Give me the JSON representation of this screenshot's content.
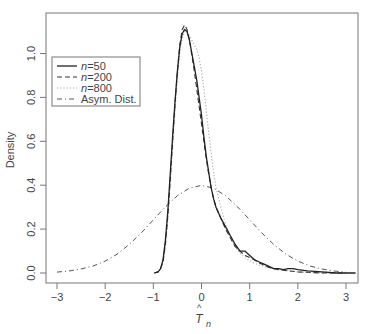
{
  "chart_data": {
    "type": "line",
    "title": "",
    "xlabel": "T̂n",
    "ylabel": "Density",
    "xlim": [
      -3.2,
      3.2
    ],
    "ylim": [
      -0.03,
      1.18
    ],
    "xticks": [
      -3,
      -2,
      -1,
      0,
      1,
      2,
      3
    ],
    "yticks": [
      0.0,
      0.2,
      0.4,
      0.6,
      0.8,
      1.0
    ],
    "ytick_labels": [
      "0.0",
      "0.2",
      "0.4",
      "0.6",
      "0.8",
      "1.0"
    ],
    "grid": false,
    "legend_position": "upper-left",
    "series": [
      {
        "name": "n=50",
        "style": "solid",
        "x": [
          -0.98,
          -0.9,
          -0.85,
          -0.8,
          -0.75,
          -0.7,
          -0.65,
          -0.6,
          -0.55,
          -0.5,
          -0.45,
          -0.4,
          -0.35,
          -0.3,
          -0.25,
          -0.2,
          -0.15,
          -0.1,
          -0.05,
          0.0,
          0.05,
          0.1,
          0.15,
          0.2,
          0.25,
          0.3,
          0.4,
          0.5,
          0.6,
          0.7,
          0.8,
          0.9,
          1.0,
          1.1,
          1.2,
          1.3,
          1.4,
          1.5,
          1.6,
          1.7,
          1.8,
          1.9,
          2.0,
          2.2,
          2.5,
          2.8,
          3.2
        ],
        "y": [
          0.0,
          0.005,
          0.02,
          0.06,
          0.15,
          0.28,
          0.45,
          0.62,
          0.78,
          0.92,
          1.03,
          1.09,
          1.11,
          1.1,
          1.06,
          1.0,
          0.94,
          0.88,
          0.8,
          0.72,
          0.62,
          0.53,
          0.46,
          0.39,
          0.34,
          0.3,
          0.25,
          0.21,
          0.17,
          0.13,
          0.1,
          0.1,
          0.08,
          0.06,
          0.05,
          0.04,
          0.03,
          0.02,
          0.02,
          0.015,
          0.02,
          0.02,
          0.015,
          0.01,
          0.005,
          0.0,
          0.0
        ]
      },
      {
        "name": "n=200",
        "style": "dashed",
        "x": [
          -0.98,
          -0.9,
          -0.85,
          -0.8,
          -0.75,
          -0.7,
          -0.65,
          -0.6,
          -0.55,
          -0.5,
          -0.45,
          -0.4,
          -0.35,
          -0.3,
          -0.25,
          -0.2,
          -0.15,
          -0.1,
          -0.05,
          0.0,
          0.05,
          0.1,
          0.15,
          0.2,
          0.25,
          0.3,
          0.4,
          0.5,
          0.6,
          0.7,
          0.8,
          0.9,
          1.0,
          1.1,
          1.2,
          1.3,
          1.4,
          1.5,
          1.6,
          1.8,
          2.0,
          2.2,
          2.5,
          3.0
        ],
        "y": [
          0.0,
          0.005,
          0.02,
          0.05,
          0.13,
          0.26,
          0.42,
          0.6,
          0.77,
          0.92,
          1.04,
          1.11,
          1.13,
          1.11,
          1.06,
          0.99,
          0.92,
          0.84,
          0.76,
          0.68,
          0.6,
          0.52,
          0.45,
          0.39,
          0.34,
          0.3,
          0.25,
          0.2,
          0.16,
          0.12,
          0.1,
          0.08,
          0.07,
          0.06,
          0.045,
          0.035,
          0.025,
          0.02,
          0.015,
          0.01,
          0.005,
          0.003,
          0.0,
          0.0
        ]
      },
      {
        "name": "n=800",
        "style": "dotted",
        "x": [
          -0.98,
          -0.9,
          -0.85,
          -0.8,
          -0.75,
          -0.7,
          -0.65,
          -0.6,
          -0.55,
          -0.5,
          -0.45,
          -0.4,
          -0.35,
          -0.3,
          -0.25,
          -0.2,
          -0.15,
          -0.1,
          -0.05,
          0.0,
          0.05,
          0.1,
          0.15,
          0.2,
          0.25,
          0.3,
          0.4,
          0.5,
          0.6,
          0.7,
          0.8,
          0.9,
          1.0,
          1.1,
          1.2,
          1.4,
          1.6,
          1.8,
          2.0,
          2.5,
          3.0
        ],
        "y": [
          0.0,
          0.005,
          0.02,
          0.05,
          0.12,
          0.24,
          0.4,
          0.57,
          0.74,
          0.89,
          1.0,
          1.07,
          1.1,
          1.1,
          1.08,
          1.06,
          1.04,
          1.02,
          0.98,
          0.92,
          0.84,
          0.74,
          0.64,
          0.55,
          0.46,
          0.39,
          0.3,
          0.22,
          0.16,
          0.12,
          0.09,
          0.07,
          0.055,
          0.045,
          0.035,
          0.025,
          0.015,
          0.01,
          0.005,
          0.0,
          0.0
        ]
      },
      {
        "name": "Asym. Dist.",
        "style": "dashdot",
        "x": [
          -3.0,
          -2.75,
          -2.5,
          -2.25,
          -2.0,
          -1.75,
          -1.5,
          -1.25,
          -1.0,
          -0.75,
          -0.5,
          -0.25,
          0.0,
          0.25,
          0.5,
          0.75,
          1.0,
          1.25,
          1.5,
          1.75,
          2.0,
          2.25,
          2.5,
          2.75,
          3.0
        ],
        "y": [
          0.004,
          0.009,
          0.018,
          0.032,
          0.054,
          0.086,
          0.13,
          0.183,
          0.242,
          0.301,
          0.352,
          0.387,
          0.399,
          0.387,
          0.352,
          0.301,
          0.242,
          0.183,
          0.13,
          0.086,
          0.054,
          0.032,
          0.018,
          0.009,
          0.004
        ]
      }
    ]
  },
  "legend": {
    "items": [
      {
        "prefix": "n",
        "suffix": "=50",
        "label": "n=50"
      },
      {
        "prefix": "n",
        "suffix": "=200",
        "label": "n=200"
      },
      {
        "prefix": "n",
        "suffix": "=800",
        "label": "n=800"
      },
      {
        "prefix": "",
        "suffix": "Asym. Dist.",
        "label": "Asym. Dist."
      }
    ]
  },
  "axes": {
    "xlabel_base": "T",
    "xlabel_hat": "^",
    "xlabel_sub": "n",
    "ylabel": "Density"
  }
}
